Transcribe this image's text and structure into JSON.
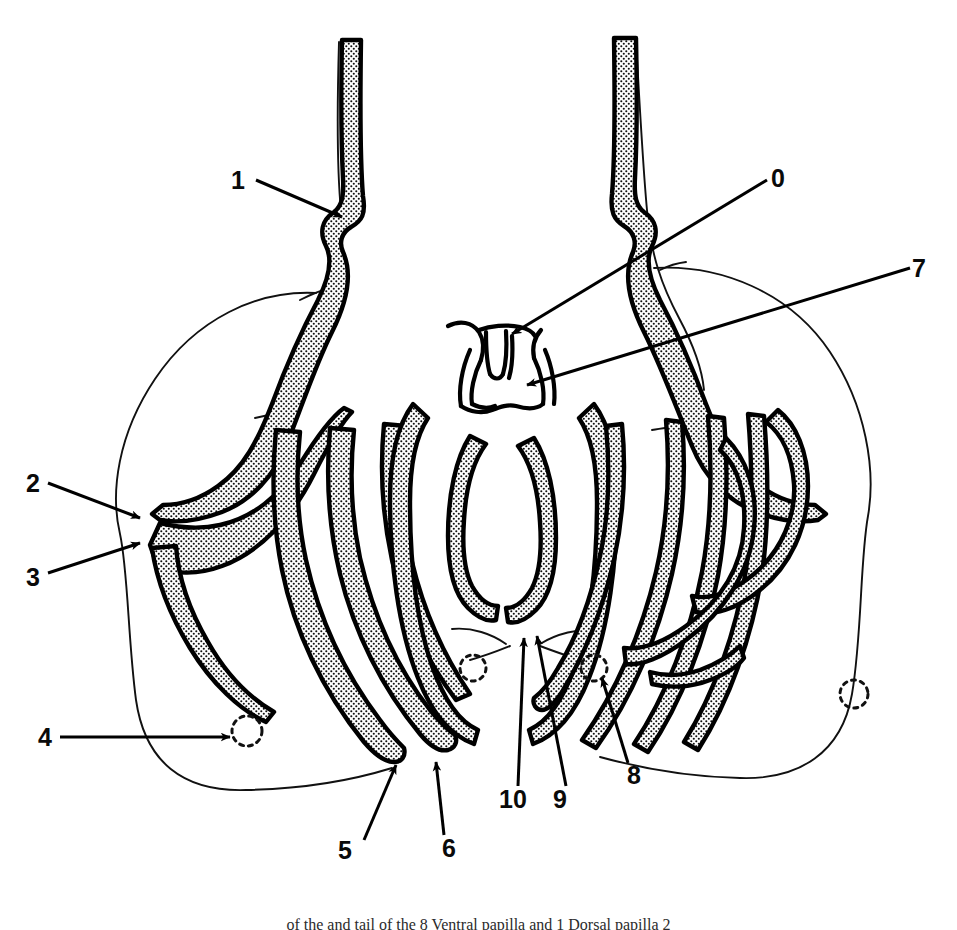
{
  "figure": {
    "kind": "anatomical-line-drawing",
    "background_color": "#ffffff",
    "ink_color": "#000000",
    "stipple_color": "#101010",
    "caption": "of the and tail of the 8 Ventral papilla and 1 Dorsal papilla 2"
  },
  "callouts": [
    {
      "id": "0",
      "label": "0",
      "x": 771,
      "y": 167,
      "target": "central-papilla-upper"
    },
    {
      "id": "1",
      "label": "1",
      "x": 231,
      "y": 169,
      "target": "left-tube-notch"
    },
    {
      "id": "2",
      "label": "2",
      "x": 27,
      "y": 472,
      "target": "left-lobe-upper-notch"
    },
    {
      "id": "3",
      "label": "3",
      "x": 27,
      "y": 566,
      "target": "left-lobe-lower-notch"
    },
    {
      "id": "4",
      "label": "4",
      "x": 39,
      "y": 726,
      "target": "left-arm-tip-circle"
    },
    {
      "id": "5",
      "label": "5",
      "x": 338,
      "y": 840,
      "target": "left-inner-arm-tip"
    },
    {
      "id": "6",
      "label": "6",
      "x": 442,
      "y": 838,
      "target": "left-median-arm-tip"
    },
    {
      "id": "7",
      "label": "7",
      "x": 912,
      "y": 257,
      "target": "central-papilla-lower"
    },
    {
      "id": "8",
      "label": "8",
      "x": 627,
      "y": 765,
      "target": "right-inner-arm-base-circle"
    },
    {
      "id": "9",
      "label": "9",
      "x": 553,
      "y": 788,
      "target": "median-lobe-right-tip"
    },
    {
      "id": "10",
      "label": "10",
      "x": 501,
      "y": 788,
      "target": "median-lobe-left-tip"
    }
  ],
  "geometry": {
    "canvas_width": 957,
    "canvas_height": 930,
    "stroke_width_main": 4.5,
    "stroke_width_thin": 1.8,
    "stroke_width_leader": 3.0
  }
}
